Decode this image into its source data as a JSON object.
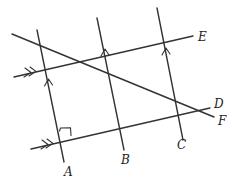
{
  "diagram": {
    "colors": {
      "stroke": "#333333",
      "label": "#222222",
      "background": "#ffffff"
    },
    "labels": {
      "A": "A",
      "B": "B",
      "C": "C",
      "D": "D",
      "E": "E",
      "F": "F"
    },
    "lines": [
      {
        "name": "vertical-A",
        "from": [
          37,
          30
        ],
        "to": [
          64,
          162
        ]
      },
      {
        "name": "vertical-B",
        "from": [
          97,
          18
        ],
        "to": [
          124,
          150
        ]
      },
      {
        "name": "vertical-C",
        "from": [
          157,
          8
        ],
        "to": [
          183,
          140
        ]
      },
      {
        "name": "parallel-E",
        "from": [
          14,
          77
        ],
        "to": [
          193,
          36
        ],
        "marker": "double-arrow"
      },
      {
        "name": "parallel-D",
        "from": [
          31,
          149
        ],
        "to": [
          210,
          108
        ],
        "marker": "double-arrow"
      },
      {
        "name": "transversal-F",
        "from": [
          12,
          34
        ],
        "to": [
          214,
          117
        ]
      }
    ],
    "annotations": {
      "right_angle_at": "A",
      "single_arrows_on": [
        "vertical-A",
        "vertical-B",
        "vertical-C"
      ]
    }
  }
}
